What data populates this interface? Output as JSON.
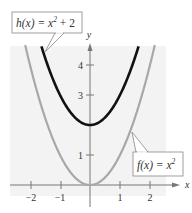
{
  "chart_data": {
    "type": "line",
    "title": "",
    "xlabel": "x",
    "ylabel": "y",
    "xlim": [
      -2.3,
      2.5
    ],
    "ylim": [
      -0.4,
      4.7
    ],
    "x_ticks": [
      "-2",
      "-1",
      "1",
      "2"
    ],
    "y_ticks": [
      "1",
      "3",
      "4"
    ],
    "grid": false,
    "series": [
      {
        "name": "h(x) = x² + 2",
        "formula": "x^2 + 2",
        "color": "#111111",
        "x": [
          -1.63,
          -1,
          0,
          1,
          1.63
        ],
        "y": [
          4.67,
          3,
          2,
          3,
          4.67
        ]
      },
      {
        "name": "f(x) = x²",
        "formula": "x^2",
        "color": "#a8a8a8",
        "x": [
          -2.16,
          -2,
          -1,
          0,
          1,
          2,
          2.16
        ],
        "y": [
          4.67,
          4,
          1,
          0,
          1,
          4,
          4.67
        ]
      }
    ],
    "annotations": [
      {
        "text": "h(x) = x² + 2",
        "target_series": "h(x) = x² + 2"
      },
      {
        "text": "f(x) = x²",
        "target_series": "f(x) = x²"
      }
    ]
  },
  "labels": {
    "h_name": "h(x) = x",
    "h_exp": "2",
    "h_tail": " + 2",
    "f_name": "f(x) = x",
    "f_exp": "2",
    "x_axis": "x",
    "y_axis": "y",
    "xt_m2": "−2",
    "xt_m1": "−1",
    "xt_1": "1",
    "xt_2": "2",
    "yt_1": "1",
    "yt_3": "3",
    "yt_4": "4"
  }
}
